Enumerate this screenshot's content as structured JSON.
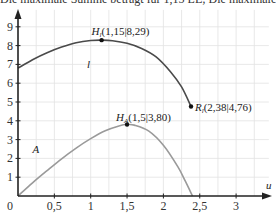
{
  "caption": "Die maximale Summe beträgt für 1,15 LE; Die maximale Grö",
  "chart_data": {
    "type": "line",
    "xlabel": "u",
    "ylabel": "",
    "xlim": [
      0,
      3.45
    ],
    "ylim": [
      0,
      9.9
    ],
    "x_ticks": [
      0.5,
      1,
      1.5,
      2,
      2.5,
      3
    ],
    "x_tick_labels": [
      "0,5",
      "1",
      "1,5",
      "2",
      "2,5",
      "3"
    ],
    "y_ticks": [
      1,
      2,
      3,
      4,
      5,
      6,
      7,
      8,
      9
    ],
    "y_tick_labels": [
      "1",
      "2",
      "3",
      "4",
      "5",
      "6",
      "7",
      "8",
      "9"
    ],
    "origin_label": "0",
    "grid": true,
    "grid_x_step": 0.25,
    "grid_y_step": 1,
    "series": [
      {
        "name": "l",
        "color": "#4a4a4a",
        "x": [
          0,
          0.2,
          0.4,
          0.6,
          0.8,
          1.0,
          1.15,
          1.3,
          1.5,
          1.7,
          1.9,
          2.1,
          2.25,
          2.38
        ],
        "y": [
          6.8,
          7.25,
          7.62,
          7.92,
          8.15,
          8.27,
          8.29,
          8.26,
          8.12,
          7.85,
          7.4,
          6.6,
          5.8,
          4.76
        ]
      },
      {
        "name": "A",
        "color": "#9a9a9a",
        "x": [
          0,
          0.2,
          0.4,
          0.6,
          0.8,
          1.0,
          1.2,
          1.4,
          1.5,
          1.6,
          1.8,
          2.0,
          2.2,
          2.3,
          2.4
        ],
        "y": [
          0,
          0.7,
          1.35,
          1.98,
          2.55,
          3.05,
          3.47,
          3.74,
          3.8,
          3.77,
          3.45,
          2.7,
          1.55,
          0.8,
          0
        ]
      }
    ],
    "series_labels": [
      {
        "text": "l",
        "x": 0.95,
        "y": 6.8
      },
      {
        "text": "A",
        "x": 0.2,
        "y": 2.3
      }
    ],
    "points": [
      {
        "name": "H_l",
        "main": "H",
        "sub": "l",
        "coords": "(1,15|8,29)",
        "x": 1.15,
        "y": 8.29
      },
      {
        "name": "R_l",
        "main": "R",
        "sub": "l",
        "coords": "(2,38|4,76)",
        "x": 2.38,
        "y": 4.76
      },
      {
        "name": "H_A",
        "main": "H",
        "sub": "A",
        "coords": "(1,5|3,80)",
        "x": 1.5,
        "y": 3.8
      }
    ]
  }
}
